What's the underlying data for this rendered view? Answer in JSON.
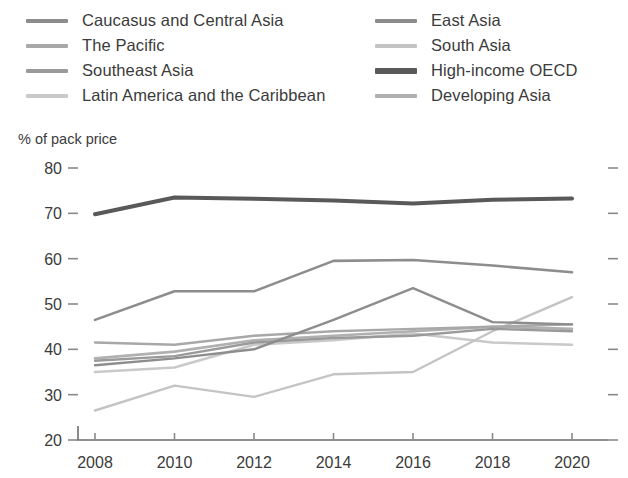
{
  "chart_data": {
    "type": "line",
    "title": "",
    "subtitle": "",
    "xlabel": "",
    "ylabel": "% of pack price",
    "x": [
      2008,
      2010,
      2012,
      2014,
      2016,
      2018,
      2020
    ],
    "xtick_labels": [
      "2008",
      "2010",
      "2012",
      "2014",
      "2016",
      "2018",
      "2020"
    ],
    "ytick_labels": [
      "80",
      "70",
      "60",
      "50",
      "40",
      "30",
      "20"
    ],
    "ylim": [
      20,
      80
    ],
    "ytick_step": 10,
    "grid": false,
    "legend_position": "top",
    "legend_columns": 2,
    "series": [
      {
        "name": "Caucasus and Central Asia",
        "color": "#8d8d8d",
        "width": 2.6,
        "values": [
          46.5,
          52.8,
          52.8,
          59.5,
          59.7,
          58.5,
          57.0
        ]
      },
      {
        "name": "East Asia",
        "color": "#8d8d8d",
        "width": 2.4,
        "values": [
          36.5,
          38.0,
          40.0,
          46.5,
          53.5,
          46.0,
          45.5
        ]
      },
      {
        "name": "The Pacific",
        "color": "#a8a8a8",
        "width": 2.4,
        "values": [
          41.5,
          41.0,
          43.0,
          44.0,
          44.5,
          45.0,
          45.5
        ]
      },
      {
        "name": "South Asia",
        "color": "#c4c4c4",
        "width": 2.4,
        "values": [
          26.5,
          32.0,
          29.5,
          34.5,
          35.0,
          44.0,
          51.5
        ]
      },
      {
        "name": "Southeast Asia",
        "color": "#9a9a9a",
        "width": 2.4,
        "values": [
          37.5,
          38.5,
          41.5,
          42.5,
          43.0,
          44.5,
          44.0
        ]
      },
      {
        "name": "High-income OECD",
        "color": "#595959",
        "width": 4.0,
        "values": [
          69.8,
          73.5,
          73.2,
          72.8,
          72.2,
          73.0,
          73.3
        ]
      },
      {
        "name": "Latin America and the Caribbean",
        "color": "#c9c9c9",
        "width": 2.6,
        "values": [
          35.0,
          36.0,
          41.0,
          42.0,
          43.5,
          41.5,
          41.0
        ]
      },
      {
        "name": "Developing Asia",
        "color": "#b0b0b0",
        "width": 2.6,
        "values": [
          38.0,
          39.5,
          42.0,
          43.0,
          44.0,
          45.0,
          44.5
        ]
      }
    ]
  },
  "legend": {
    "left_column": [
      {
        "label": "Caucasus and Central Asia",
        "color": "#8d8d8d",
        "thick": false
      },
      {
        "label": "The Pacific",
        "color": "#a8a8a8",
        "thick": false
      },
      {
        "label": "Southeast Asia",
        "color": "#9a9a9a",
        "thick": false
      },
      {
        "label": "Latin America and the Caribbean",
        "color": "#c9c9c9",
        "thick": false
      }
    ],
    "right_column": [
      {
        "label": "East Asia",
        "color": "#8d8d8d",
        "thick": false
      },
      {
        "label": "South Asia",
        "color": "#c4c4c4",
        "thick": false
      },
      {
        "label": "High-income OECD",
        "color": "#595959",
        "thick": true
      },
      {
        "label": "Developing Asia",
        "color": "#b0b0b0",
        "thick": false
      }
    ]
  }
}
